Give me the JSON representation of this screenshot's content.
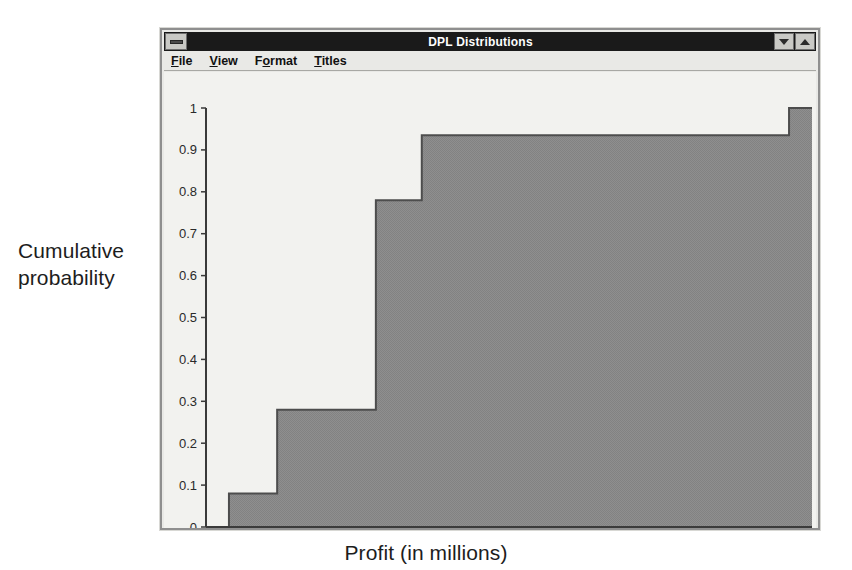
{
  "window": {
    "title": "DPL Distributions",
    "sysmenu_icon": "system-menu-icon",
    "minimize_icon": "minimize-icon",
    "maximize_icon": "maximize-icon",
    "menus": [
      {
        "label": "File",
        "accel": "F"
      },
      {
        "label": "View",
        "accel": "V"
      },
      {
        "label": "Format",
        "accel": "o"
      },
      {
        "label": "Titles",
        "accel": "T"
      }
    ]
  },
  "labels": {
    "y_axis_line1": "Cumulative",
    "y_axis_line2": "probability",
    "x_axis": "Profit (in millions)"
  },
  "colors": {
    "fill": "#8a8a8a",
    "outline": "#4d4d4d",
    "axis": "#3a3a3a",
    "plot_background": "#f2f2ef",
    "window_background": "#e9e9e6",
    "title_bar": "#1a1a1a"
  },
  "chart_data": {
    "type": "line",
    "subtype": "cumulative-step-area",
    "title": "DPL Distributions",
    "xlabel": "Profit (in millions)",
    "ylabel": "Cumulative probability",
    "xlim": [
      -52,
      212
    ],
    "ylim": [
      0,
      1
    ],
    "grid": false,
    "legend": null,
    "xticks": [
      -50,
      -25,
      0,
      25,
      50,
      75,
      100,
      125,
      150,
      175,
      200
    ],
    "yticks": [
      0,
      0.1,
      0.2,
      0.3,
      0.4,
      0.5,
      0.6,
      0.7,
      0.8,
      0.9,
      1
    ],
    "xticklabels": [
      "-50",
      "-25",
      "0",
      "25",
      "50",
      "75",
      "100",
      "125",
      "150",
      "175",
      "200"
    ],
    "yticklabels": [
      "0",
      "0.1",
      "0.2",
      "0.3",
      "0.4",
      "0.5",
      "0.6",
      "0.7",
      "0.8",
      "0.9",
      "1"
    ],
    "steps": [
      {
        "x": -42,
        "cumulative_probability": 0.08
      },
      {
        "x": -21,
        "cumulative_probability": 0.28
      },
      {
        "x": 22,
        "cumulative_probability": 0.78
      },
      {
        "x": 42,
        "cumulative_probability": 0.935
      },
      {
        "x": 202,
        "cumulative_probability": 1.0
      },
      {
        "x": 212,
        "cumulative_probability": 1.0
      }
    ],
    "x": [
      -42,
      -21,
      22,
      42,
      202,
      212
    ],
    "values": [
      0.08,
      0.28,
      0.78,
      0.935,
      1.0,
      1.0
    ]
  }
}
